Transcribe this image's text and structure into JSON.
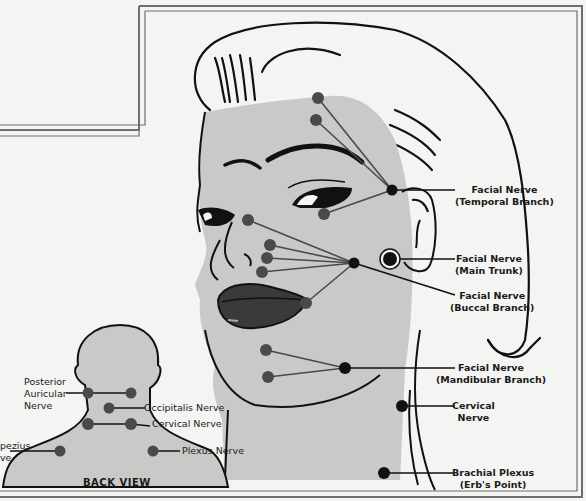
{
  "diagram": {
    "title_cutoff": "...y g...",
    "front_view": {
      "labels": [
        {
          "id": "temporal",
          "line1": "Facial Nerve",
          "line2": "(Temporal Branch)"
        },
        {
          "id": "main-trunk",
          "line1": "Facial Nerve",
          "line2": "(Main Trunk)"
        },
        {
          "id": "buccal",
          "line1": "Facial Nerve",
          "line2": "(Buccal Branch)"
        },
        {
          "id": "mandibular",
          "line1": "Facial Nerve",
          "line2": "(Mandibular Branch)"
        },
        {
          "id": "cervical",
          "line1": "Cervical",
          "line2": "Nerve"
        },
        {
          "id": "brachial",
          "line1": "Brachial Plexus",
          "line2": "(Erb's Point)"
        }
      ]
    },
    "back_view": {
      "title": "BACK VIEW",
      "labels": [
        {
          "id": "posterior-auricular",
          "line1": "Posterior",
          "line2": "Auricular",
          "line3": "Nerve"
        },
        {
          "id": "occipitalis",
          "text": "Occipitalis Nerve"
        },
        {
          "id": "cervical-back",
          "text": "Cervical Nerve"
        },
        {
          "id": "trapezius",
          "line1": "pezius",
          "line2": "ve"
        },
        {
          "id": "plexus",
          "text": "Plexus Nerve"
        }
      ]
    },
    "colors": {
      "skin": "#c9c9c7",
      "ink": "#111111",
      "point": "#4a4a4a",
      "background": "#f4f4f2",
      "frame": "#777777"
    }
  }
}
